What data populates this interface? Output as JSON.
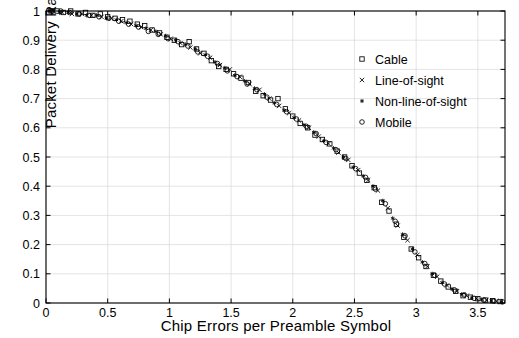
{
  "chart_data": {
    "type": "scatter",
    "title": "",
    "xlabel": "Chip Errors per Preamble Symbol",
    "ylabel": "Packet Delivery Ratio",
    "xlim": [
      0,
      3.72
    ],
    "ylim": [
      0,
      1.0
    ],
    "xticks": [
      0,
      0.5,
      1,
      1.5,
      2,
      2.5,
      3,
      3.5
    ],
    "xticklabels": [
      "0",
      "0.5",
      "1",
      "1.5",
      "2",
      "2.5",
      "3",
      "3.5"
    ],
    "yticks": [
      0,
      0.1,
      0.2,
      0.3,
      0.4,
      0.5,
      0.6,
      0.7,
      0.8,
      0.9,
      1
    ],
    "yticklabels": [
      "0",
      "0.1",
      "0.2",
      "0.3",
      "0.4",
      "0.5",
      "0.6",
      "0.7",
      "0.8",
      "0.9",
      "1"
    ],
    "grid": true,
    "grid_color": "#d8d8d8",
    "axis_color": "#000000",
    "marker_color": "#000000",
    "legend_position": "upper-right-inside",
    "legend": [
      {
        "name": "Cable",
        "marker": "square"
      },
      {
        "name": "Line-of-sight",
        "marker": "x"
      },
      {
        "name": "Non-line-of-sight",
        "marker": "star"
      },
      {
        "name": "Mobile",
        "marker": "circle"
      }
    ],
    "series": [
      {
        "name": "Cable",
        "marker": "square",
        "points": [
          [
            0.04,
            1.0
          ],
          [
            0.09,
            1.0
          ],
          [
            0.14,
            0.995
          ],
          [
            0.2,
            1.0
          ],
          [
            0.26,
            0.99
          ],
          [
            0.32,
            0.995
          ],
          [
            0.38,
            0.985
          ],
          [
            0.44,
            0.99
          ],
          [
            0.5,
            0.98
          ],
          [
            0.56,
            0.975
          ],
          [
            0.62,
            0.97
          ],
          [
            0.68,
            0.965
          ],
          [
            0.74,
            0.955
          ],
          [
            0.8,
            0.95
          ],
          [
            0.86,
            0.935
          ],
          [
            0.92,
            0.925
          ],
          [
            0.98,
            0.91
          ],
          [
            1.04,
            0.9
          ],
          [
            1.1,
            0.885
          ],
          [
            1.16,
            0.895
          ],
          [
            1.22,
            0.87
          ],
          [
            1.28,
            0.855
          ],
          [
            1.34,
            0.83
          ],
          [
            1.4,
            0.81
          ],
          [
            1.46,
            0.8
          ],
          [
            1.52,
            0.785
          ],
          [
            1.58,
            0.77
          ],
          [
            1.64,
            0.755
          ],
          [
            1.7,
            0.725
          ],
          [
            1.76,
            0.71
          ],
          [
            1.82,
            0.695
          ],
          [
            1.88,
            0.7
          ],
          [
            1.94,
            0.665
          ],
          [
            2.0,
            0.64
          ],
          [
            2.06,
            0.615
          ],
          [
            2.12,
            0.6
          ],
          [
            2.18,
            0.575
          ],
          [
            2.24,
            0.56
          ],
          [
            2.3,
            0.545
          ],
          [
            2.36,
            0.52
          ],
          [
            2.42,
            0.5
          ],
          [
            2.48,
            0.47
          ],
          [
            2.54,
            0.445
          ],
          [
            2.6,
            0.42
          ],
          [
            2.66,
            0.395
          ],
          [
            2.72,
            0.345
          ],
          [
            2.78,
            0.315
          ],
          [
            2.84,
            0.27
          ],
          [
            2.9,
            0.225
          ],
          [
            2.96,
            0.185
          ],
          [
            3.02,
            0.155
          ],
          [
            3.08,
            0.125
          ],
          [
            3.14,
            0.095
          ],
          [
            3.2,
            0.075
          ],
          [
            3.26,
            0.055
          ],
          [
            3.32,
            0.04
          ],
          [
            3.38,
            0.025
          ],
          [
            3.44,
            0.02
          ],
          [
            3.5,
            0.015
          ],
          [
            3.56,
            0.01
          ],
          [
            3.62,
            0.008
          ],
          [
            3.68,
            0.005
          ]
        ]
      },
      {
        "name": "Line-of-sight",
        "marker": "x",
        "points": [
          [
            0.06,
            1.0
          ],
          [
            0.13,
            0.995
          ],
          [
            0.21,
            0.99
          ],
          [
            0.29,
            0.99
          ],
          [
            0.37,
            0.985
          ],
          [
            0.45,
            0.98
          ],
          [
            0.53,
            0.975
          ],
          [
            0.61,
            0.965
          ],
          [
            0.69,
            0.955
          ],
          [
            0.77,
            0.945
          ],
          [
            0.85,
            0.935
          ],
          [
            0.93,
            0.92
          ],
          [
            1.01,
            0.905
          ],
          [
            1.09,
            0.89
          ],
          [
            1.17,
            0.875
          ],
          [
            1.25,
            0.855
          ],
          [
            1.33,
            0.84
          ],
          [
            1.41,
            0.815
          ],
          [
            1.49,
            0.8
          ],
          [
            1.57,
            0.775
          ],
          [
            1.65,
            0.75
          ],
          [
            1.73,
            0.73
          ],
          [
            1.81,
            0.7
          ],
          [
            1.89,
            0.675
          ],
          [
            1.97,
            0.65
          ],
          [
            2.05,
            0.625
          ],
          [
            2.13,
            0.6
          ],
          [
            2.21,
            0.57
          ],
          [
            2.29,
            0.545
          ],
          [
            2.37,
            0.515
          ],
          [
            2.45,
            0.49
          ],
          [
            2.53,
            0.455
          ],
          [
            2.61,
            0.42
          ],
          [
            2.69,
            0.385
          ],
          [
            2.77,
            0.325
          ],
          [
            2.85,
            0.265
          ],
          [
            2.93,
            0.215
          ],
          [
            3.01,
            0.165
          ],
          [
            3.09,
            0.125
          ],
          [
            3.17,
            0.09
          ],
          [
            3.25,
            0.06
          ],
          [
            3.33,
            0.04
          ],
          [
            3.41,
            0.025
          ],
          [
            3.49,
            0.015
          ],
          [
            3.57,
            0.01
          ],
          [
            3.65,
            0.006
          ]
        ]
      },
      {
        "name": "Non-line-of-sight",
        "marker": "star",
        "points": [
          [
            0.03,
            1.0
          ],
          [
            0.11,
            0.995
          ],
          [
            0.18,
            0.995
          ],
          [
            0.25,
            0.99
          ],
          [
            0.33,
            0.985
          ],
          [
            0.41,
            0.985
          ],
          [
            0.49,
            0.975
          ],
          [
            0.57,
            0.97
          ],
          [
            0.65,
            0.96
          ],
          [
            0.73,
            0.95
          ],
          [
            0.81,
            0.94
          ],
          [
            0.89,
            0.93
          ],
          [
            0.97,
            0.915
          ],
          [
            1.05,
            0.9
          ],
          [
            1.13,
            0.885
          ],
          [
            1.21,
            0.87
          ],
          [
            1.29,
            0.85
          ],
          [
            1.37,
            0.825
          ],
          [
            1.45,
            0.805
          ],
          [
            1.53,
            0.78
          ],
          [
            1.61,
            0.76
          ],
          [
            1.69,
            0.735
          ],
          [
            1.77,
            0.715
          ],
          [
            1.85,
            0.685
          ],
          [
            1.93,
            0.66
          ],
          [
            2.01,
            0.635
          ],
          [
            2.09,
            0.61
          ],
          [
            2.17,
            0.585
          ],
          [
            2.25,
            0.555
          ],
          [
            2.33,
            0.53
          ],
          [
            2.41,
            0.5
          ],
          [
            2.49,
            0.465
          ],
          [
            2.57,
            0.435
          ],
          [
            2.65,
            0.4
          ],
          [
            2.73,
            0.35
          ],
          [
            2.81,
            0.29
          ],
          [
            2.89,
            0.235
          ],
          [
            2.97,
            0.185
          ],
          [
            3.05,
            0.14
          ],
          [
            3.13,
            0.1
          ],
          [
            3.21,
            0.07
          ],
          [
            3.29,
            0.048
          ],
          [
            3.37,
            0.03
          ],
          [
            3.45,
            0.018
          ],
          [
            3.53,
            0.012
          ],
          [
            3.61,
            0.008
          ],
          [
            3.69,
            0.004
          ]
        ]
      },
      {
        "name": "Mobile",
        "marker": "circle",
        "points": [
          [
            0.05,
            1.0
          ],
          [
            0.12,
            1.0
          ],
          [
            0.19,
            0.995
          ],
          [
            0.27,
            0.99
          ],
          [
            0.35,
            0.985
          ],
          [
            0.43,
            0.98
          ],
          [
            0.51,
            0.975
          ],
          [
            0.59,
            0.965
          ],
          [
            0.67,
            0.955
          ],
          [
            0.75,
            0.945
          ],
          [
            0.83,
            0.93
          ],
          [
            0.91,
            0.92
          ],
          [
            0.99,
            0.905
          ],
          [
            1.07,
            0.895
          ],
          [
            1.15,
            0.88
          ],
          [
            1.23,
            0.86
          ],
          [
            1.31,
            0.845
          ],
          [
            1.39,
            0.82
          ],
          [
            1.47,
            0.795
          ],
          [
            1.55,
            0.775
          ],
          [
            1.63,
            0.75
          ],
          [
            1.71,
            0.73
          ],
          [
            1.79,
            0.705
          ],
          [
            1.87,
            0.68
          ],
          [
            1.95,
            0.655
          ],
          [
            2.03,
            0.63
          ],
          [
            2.11,
            0.605
          ],
          [
            2.19,
            0.58
          ],
          [
            2.27,
            0.55
          ],
          [
            2.35,
            0.525
          ],
          [
            2.43,
            0.495
          ],
          [
            2.51,
            0.46
          ],
          [
            2.59,
            0.43
          ],
          [
            2.67,
            0.39
          ],
          [
            2.75,
            0.34
          ],
          [
            2.83,
            0.28
          ],
          [
            2.91,
            0.23
          ],
          [
            2.99,
            0.175
          ],
          [
            3.07,
            0.135
          ],
          [
            3.15,
            0.095
          ],
          [
            3.23,
            0.065
          ],
          [
            3.31,
            0.045
          ],
          [
            3.39,
            0.028
          ],
          [
            3.47,
            0.016
          ],
          [
            3.55,
            0.01
          ],
          [
            3.63,
            0.007
          ],
          [
            3.7,
            0.004
          ]
        ]
      }
    ]
  }
}
